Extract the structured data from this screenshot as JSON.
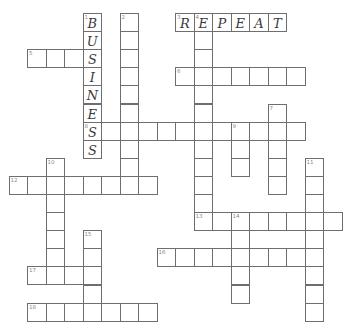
{
  "puzzle": {
    "type": "crossword",
    "grid": {
      "origin_x": 8.6,
      "origin_y": 13,
      "cell_w": 18.5,
      "cell_h": 18.1,
      "border_color": "#6e6e6e",
      "letter_color": "#3a3a3a",
      "number_color": "#8a8a8a"
    },
    "entries": [
      {
        "number": 1,
        "direction": "down",
        "row": 0,
        "col": 4,
        "length": 8,
        "answer": "BUSINESS"
      },
      {
        "number": 2,
        "direction": "down",
        "row": 0,
        "col": 6,
        "length": 10,
        "answer": ""
      },
      {
        "number": 3,
        "direction": "across",
        "row": 0,
        "col": 9,
        "length": 6,
        "answer": "REPEAT"
      },
      {
        "number": 4,
        "direction": "down",
        "row": 0,
        "col": 10,
        "length": 12,
        "answer": "E"
      },
      {
        "number": 5,
        "direction": "across",
        "row": 2,
        "col": 1,
        "length": 4,
        "answer": "   S"
      },
      {
        "number": 6,
        "direction": "across",
        "row": 3,
        "col": 9,
        "length": 7,
        "answer": ""
      },
      {
        "number": 7,
        "direction": "down",
        "row": 5,
        "col": 14,
        "length": 5,
        "answer": ""
      },
      {
        "number": 8,
        "direction": "across",
        "row": 6,
        "col": 4,
        "length": 12,
        "answer": "S"
      },
      {
        "number": 9,
        "direction": "down",
        "row": 6,
        "col": 12,
        "length": 3,
        "answer": ""
      },
      {
        "number": 10,
        "direction": "down",
        "row": 8,
        "col": 2,
        "length": 7,
        "answer": ""
      },
      {
        "number": 11,
        "direction": "down",
        "row": 8,
        "col": 16,
        "length": 9,
        "answer": ""
      },
      {
        "number": 12,
        "direction": "across",
        "row": 9,
        "col": 0,
        "length": 8,
        "answer": ""
      },
      {
        "number": 13,
        "direction": "across",
        "row": 11,
        "col": 10,
        "length": 8,
        "answer": ""
      },
      {
        "number": 14,
        "direction": "down",
        "row": 11,
        "col": 12,
        "length": 5,
        "answer": ""
      },
      {
        "number": 15,
        "direction": "down",
        "row": 12,
        "col": 4,
        "length": 5,
        "answer": ""
      },
      {
        "number": 16,
        "direction": "across",
        "row": 13,
        "col": 8,
        "length": 9,
        "answer": ""
      },
      {
        "number": 17,
        "direction": "across",
        "row": 14,
        "col": 1,
        "length": 4,
        "answer": ""
      },
      {
        "number": 18,
        "direction": "across",
        "row": 16,
        "col": 1,
        "length": 7,
        "answer": ""
      }
    ],
    "filled_letters": {
      "1_down": "BUSINESS",
      "3_across": "REPEAT"
    }
  }
}
